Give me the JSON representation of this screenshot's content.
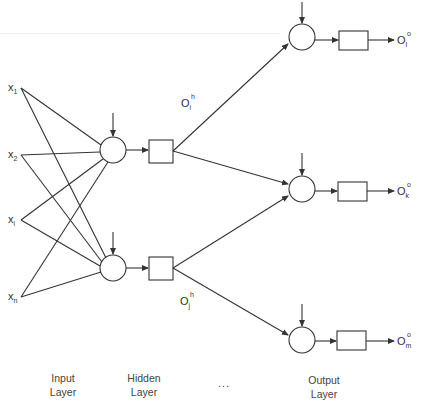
{
  "diagram": {
    "inputs": [
      {
        "name": "x",
        "sub": "1"
      },
      {
        "name": "x",
        "sub": "2"
      },
      {
        "name": "x",
        "sub": "i"
      },
      {
        "name": "x",
        "sub": "n"
      }
    ],
    "hidden_outputs": [
      {
        "name": "O",
        "sup": "h",
        "sub": "i"
      },
      {
        "name": "O",
        "sup": "h",
        "sub": "j"
      }
    ],
    "outputs": [
      {
        "name": "O",
        "sup": "o",
        "sub": "l"
      },
      {
        "name": "O",
        "sup": "o",
        "sub": "k"
      },
      {
        "name": "O",
        "sup": "o",
        "sub": "m"
      }
    ],
    "layers": {
      "input": {
        "line1": "Input",
        "line2": "Layer"
      },
      "hidden": {
        "line1": "Hidden",
        "line2": "Layer"
      },
      "ellipsis": "...",
      "output": {
        "line1": "Output",
        "line2": "Layer"
      }
    },
    "colors": {
      "stroke": "#333333",
      "background": "#ffffff"
    }
  }
}
